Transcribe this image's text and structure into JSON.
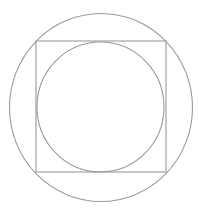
{
  "diagram": {
    "stroke_color": "#9a9a9a",
    "background": "#ffffff",
    "shapes": [
      {
        "name": "outer-circle",
        "type": "ellipse",
        "cx": 101,
        "cy": 107.5,
        "rx": 91.5,
        "ry": 94
      },
      {
        "name": "square",
        "type": "rect",
        "x": 36,
        "y": 41,
        "width": 130,
        "height": 131
      },
      {
        "name": "inner-circle",
        "type": "ellipse",
        "cx": 100.5,
        "cy": 107,
        "rx": 63.5,
        "ry": 65
      }
    ]
  }
}
